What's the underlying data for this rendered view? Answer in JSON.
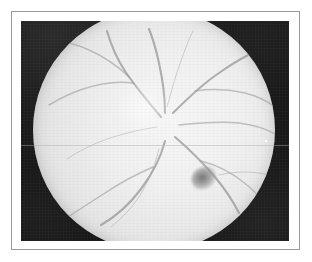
{
  "figure": {
    "kind": "photograph",
    "rendering": "black-and-white halftone print",
    "caption": "",
    "frame": {
      "border_color": "#9a9a9a",
      "page_background": "#ffffff",
      "border_width_px": 1
    },
    "photo": {
      "x": 21,
      "y": 21,
      "width": 268,
      "height": 220,
      "backdrop_color": "#131313",
      "description": "dark mottled surround outside the circular camera field"
    }
  },
  "fundus": {
    "field_shape": "circle",
    "field_cropped_edges": [
      "top",
      "bottom"
    ],
    "center_x_pct": 58,
    "center_y_pct": 47,
    "field_tone_light": "#f6f6f6",
    "field_tone_edge": "#c2c2c2",
    "optic_disc": {
      "label": "optic-disc",
      "x_pct": 46,
      "y_pct": 41,
      "tone": "#ffffff",
      "note": "bright convergence point of retinal vessels"
    },
    "lesion": {
      "label": "haemorrhage-blot",
      "x_pct": 70.5,
      "y_pct": 70,
      "tone": "#686868",
      "note": "dark irregular blot in the inferotemporal quadrant"
    },
    "specular_dot": {
      "label": "specular-highlight",
      "x": 244,
      "y": 119,
      "tone": "#ffffff"
    },
    "scan_seam": {
      "label": "horizontal-print-seam",
      "y": 124,
      "tone": "#aaaaaa"
    },
    "vessel_stroke_major": "#909090",
    "vessel_stroke_minor": "#9e9e9e"
  },
  "vessels": [
    {
      "name": "superonasal-arcade",
      "weight": "major",
      "path": "M128 108 C 118 96, 104 80, 92 62 C 84 50, 78 36, 74 22"
    },
    {
      "name": "superonasal-branch-upper",
      "weight": "mid",
      "path": "M96 68 C 86 58, 72 48, 54 40 C 42 35, 30 32, 18 30"
    },
    {
      "name": "superonasal-branch-lateral",
      "weight": "mid",
      "path": "M100 74 C 86 72, 68 74, 50 80 C 38 84, 26 90, 16 96"
    },
    {
      "name": "superior-trunk",
      "weight": "major",
      "path": "M132 104 C 132 90, 130 72, 126 54 C 123 40, 120 30, 116 20"
    },
    {
      "name": "superotemporal-arcade",
      "weight": "major",
      "path": "M140 104 C 152 92, 168 76, 186 64 C 200 54, 214 46, 228 40"
    },
    {
      "name": "superotemporal-branch",
      "weight": "mid",
      "path": "M162 82 C 176 80, 194 80, 212 84 C 224 87, 234 92, 242 98"
    },
    {
      "name": "temporal-horizontal-vessel",
      "weight": "mid",
      "path": "M146 116 C 164 114, 186 112, 206 114 C 222 116, 234 120, 244 126"
    },
    {
      "name": "inferotemporal-arcade",
      "weight": "major",
      "path": "M142 128 C 156 140, 170 154, 182 168 C 192 180, 200 192, 206 204"
    },
    {
      "name": "inferotemporal-branch-right",
      "weight": "mid",
      "path": "M168 152 C 184 156, 200 164, 214 176 C 224 184, 232 194, 238 204"
    },
    {
      "name": "inferotemporal-branch-far",
      "weight": "fine",
      "path": "M186 166 C 202 162, 220 162, 236 166 C 246 169, 254 174, 260 180"
    },
    {
      "name": "inferior-trunk",
      "weight": "major",
      "path": "M132 132 C 128 148, 120 164, 108 180 C 96 196, 82 208, 68 216"
    },
    {
      "name": "inferonasal-branch",
      "weight": "mid",
      "path": "M120 158 C 106 164, 90 172, 72 184 C 58 193, 44 202, 32 210"
    },
    {
      "name": "inferior-fine-branch",
      "weight": "fine",
      "path": "M126 140 C 122 156, 116 172, 106 188 C 98 200, 88 210, 78 218"
    },
    {
      "name": "nasal-fine-vessel",
      "weight": "fine",
      "path": "M124 118 C 110 120, 92 124, 74 130 C 60 135, 46 142, 34 150"
    },
    {
      "name": "superior-fine-vessel",
      "weight": "fine",
      "path": "M134 98 C 138 84, 142 68, 148 52 C 152 40, 156 30, 160 22"
    }
  ]
}
